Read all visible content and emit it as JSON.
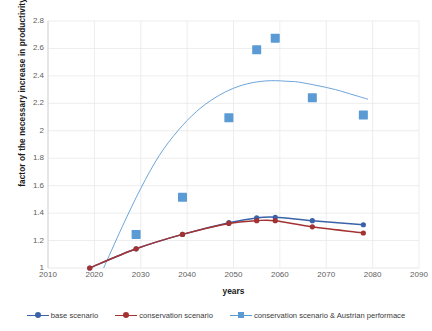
{
  "chart_data": {
    "type": "scatter",
    "title": "",
    "xlabel": "years",
    "ylabel": "factor of the necessary increase in productivity",
    "xlim": [
      2010,
      2090
    ],
    "ylim": [
      1,
      2.8
    ],
    "xticks": [
      2010,
      2020,
      2030,
      2040,
      2050,
      2060,
      2070,
      2080,
      2090
    ],
    "yticks": [
      1,
      1.2,
      1.4,
      1.6,
      1.8,
      2,
      2.2,
      2.4,
      2.6,
      2.8
    ],
    "grid": true,
    "legend_position": "bottom",
    "series": [
      {
        "name": "base scenario",
        "color": "#3a62a8",
        "marker": "circle",
        "line": true,
        "x": [
          2019,
          2029,
          2039,
          2049,
          2055,
          2059,
          2067,
          2078
        ],
        "values": [
          1.0,
          1.14,
          1.245,
          1.33,
          1.365,
          1.37,
          1.345,
          1.315
        ]
      },
      {
        "name": "conservation scenario",
        "color": "#a33232",
        "marker": "circle",
        "line": true,
        "x": [
          2019,
          2029,
          2039,
          2049,
          2055,
          2059,
          2067,
          2078
        ],
        "values": [
          1.0,
          1.14,
          1.245,
          1.325,
          1.345,
          1.345,
          1.3,
          1.255
        ]
      },
      {
        "name": "conservation scenario & Austrian performace",
        "color": "#5b9bd5",
        "marker": "square",
        "line": false,
        "x": [
          2029,
          2039,
          2049,
          2055,
          2059,
          2067,
          2078
        ],
        "values": [
          1.245,
          1.515,
          2.095,
          2.59,
          2.675,
          2.24,
          2.115
        ],
        "trendline": {
          "type": "polynomial",
          "color": "#5b9bd5",
          "x": [
            2022,
            2026,
            2030,
            2034,
            2038,
            2042,
            2046,
            2050,
            2054,
            2058,
            2062,
            2064,
            2068,
            2072,
            2076,
            2079
          ],
          "values": [
            1.0,
            1.3,
            1.58,
            1.82,
            2.0,
            2.14,
            2.24,
            2.31,
            2.35,
            2.365,
            2.36,
            2.355,
            2.33,
            2.3,
            2.26,
            2.23
          ]
        }
      }
    ]
  },
  "axes": {
    "y_title": "factor of the necessary increase in productivity",
    "x_title": "years"
  },
  "legend": {
    "items": [
      {
        "label": "base scenario",
        "color": "#3a62a8",
        "marker": "circle"
      },
      {
        "label": "conservation scenario",
        "color": "#a33232",
        "marker": "circle"
      },
      {
        "label": "conservation scenario & Austrian performace",
        "color": "#5b9bd5",
        "marker": "square"
      }
    ]
  }
}
